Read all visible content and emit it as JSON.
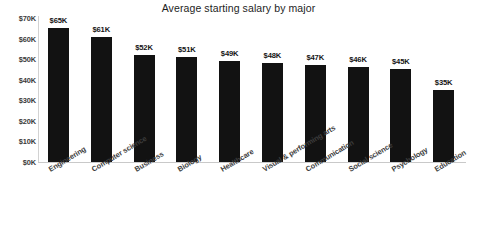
{
  "chart_data": {
    "type": "bar",
    "title": "Average starting salary by major",
    "xlabel": "",
    "ylabel": "",
    "ylim": [
      0,
      70000
    ],
    "grid": false,
    "legend": false,
    "bar_color": "#121212",
    "axis_color": "#c9c9c9",
    "categories": [
      "Engineering",
      "Computer science",
      "Business",
      "Biology",
      "Healthcare",
      "Visual & performing arts",
      "Communication",
      "Social science",
      "Psychology",
      "Education"
    ],
    "values": [
      65000,
      61000,
      52000,
      51000,
      49000,
      48000,
      47000,
      46000,
      45000,
      35000
    ],
    "value_labels": [
      "$65K",
      "$61K",
      "$52K",
      "$51K",
      "$49K",
      "$48K",
      "$47K",
      "$46K",
      "$45K",
      "$35K"
    ],
    "ytick_values": [
      70000,
      60000,
      50000,
      40000,
      30000,
      20000,
      10000,
      0
    ],
    "ytick_labels": [
      "$70K",
      "$60K",
      "$50K",
      "$40K",
      "$30K",
      "$20K",
      "$10K",
      "$0K"
    ]
  }
}
